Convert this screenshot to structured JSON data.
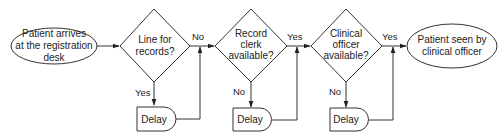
{
  "diagram": {
    "type": "flowchart",
    "nodes": {
      "start": {
        "shape": "ellipse",
        "lines": [
          "Patient arrives",
          "at the registration",
          "desk"
        ]
      },
      "q1": {
        "shape": "diamond",
        "lines": [
          "Line for",
          "records?"
        ]
      },
      "q2": {
        "shape": "diamond",
        "lines": [
          "Record",
          "clerk",
          "available?"
        ]
      },
      "q3": {
        "shape": "diamond",
        "lines": [
          "Clinical",
          "officer",
          "available?"
        ]
      },
      "end": {
        "shape": "ellipse",
        "lines": [
          "Patient seen by",
          "clinical officer"
        ]
      },
      "delay1": {
        "shape": "delay",
        "label": "Delay"
      },
      "delay2": {
        "shape": "delay",
        "label": "Delay"
      },
      "delay3": {
        "shape": "delay",
        "label": "Delay"
      }
    },
    "edges": {
      "q1_right": "No",
      "q1_down": "Yes",
      "q2_right": "Yes",
      "q2_down": "No",
      "q3_right": "Yes",
      "q3_down": "No"
    },
    "colors": {
      "stroke": "#333333",
      "text": "#222222",
      "background": "#ffffff"
    }
  }
}
